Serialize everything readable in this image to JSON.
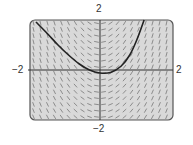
{
  "chart_data": {
    "type": "slope-field",
    "title": "",
    "xlabel": "",
    "ylabel": "",
    "xlim": [
      -2,
      2
    ],
    "ylim": [
      -2,
      2
    ],
    "tick_labels": {
      "y_top": "2",
      "y_bottom": "−2",
      "x_left": "−2",
      "x_right": "2"
    },
    "field": {
      "description": "Short line segments on a grid showing slopes; nearly horizontal near x = 0, steep negative on the left, steep positive on the right",
      "grid_columns": 20,
      "grid_rows": 16,
      "slope_model": "approximately proportional to x"
    },
    "solution_curve": {
      "points": [
        [
          -1.83,
          1.92
        ],
        [
          -1.5,
          1.45
        ],
        [
          -1.2,
          1.0
        ],
        [
          -0.9,
          0.6
        ],
        [
          -0.6,
          0.25
        ],
        [
          -0.3,
          0.0
        ],
        [
          0.0,
          -0.12
        ],
        [
          0.3,
          -0.1
        ],
        [
          0.6,
          0.15
        ],
        [
          0.85,
          0.6
        ],
        [
          1.05,
          1.2
        ],
        [
          1.26,
          2.0
        ]
      ],
      "minimum": [
        0.06,
        -0.12
      ]
    },
    "colors": {
      "background": "#d9d9d9",
      "frame": "#555555",
      "axes": "#333333",
      "field_segments": "#777777",
      "curve": "#222222"
    }
  }
}
